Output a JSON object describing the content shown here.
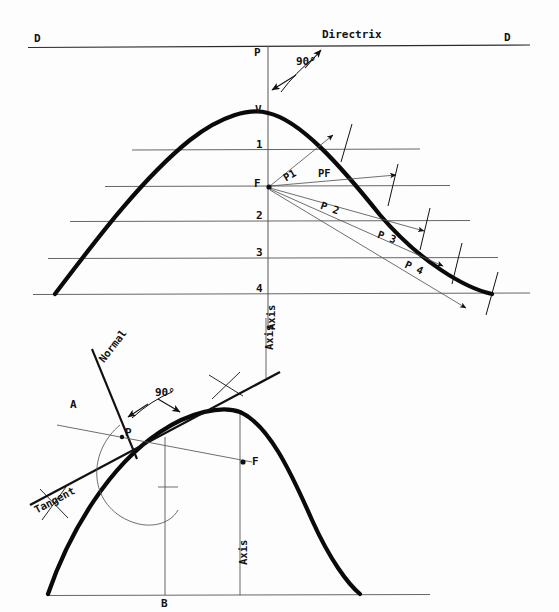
{
  "drawing": {
    "title": "Parabola construction - directrix/focus method and tangent/normal at a point",
    "ink_color": "#111111",
    "thin_color": "#555555",
    "background": "#fdfdfd"
  },
  "upper": {
    "directrix_label": "Directrix",
    "directrix_end_left": "D",
    "directrix_end_right": "D",
    "angle_label": "90°",
    "point_on_directrix": "P",
    "vertex_label": "V",
    "focus_label": "F",
    "axis_label": "Axis",
    "ordinates": [
      "1",
      "2",
      "3",
      "4"
    ],
    "rays": [
      "P1",
      "PF",
      "P 2",
      "P 3",
      "P 4"
    ]
  },
  "lower": {
    "normal_label": "Normal",
    "tangent_label": "Tangent",
    "angle_label": "90°",
    "point_label": "P",
    "aux_point_label": "A",
    "focus_label": "F",
    "base_label": "B",
    "axis_label": "Axis"
  },
  "geometry": {
    "upper": {
      "directrix_y": 46,
      "axis_x": 268,
      "vertex_y": 113,
      "focus_y": 186,
      "ordinate_y": [
        150,
        221,
        258,
        293
      ],
      "curve_left_x": 55,
      "curve_right_x": 492,
      "curve_bottom_y": 294
    },
    "lower": {
      "vertex_x": 240,
      "vertex_y": 412,
      "baseline_y": 595,
      "focus_x": 247,
      "focus_y": 462,
      "point_x": 122,
      "point_y": 437,
      "base_x": 165
    }
  }
}
